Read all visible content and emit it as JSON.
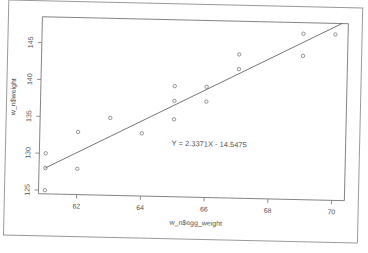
{
  "chart_data": {
    "type": "scatter",
    "title": "",
    "xlabel": "w_n$egg_weight",
    "ylabel": "w_n$weight",
    "xlim": [
      60.8,
      70.4
    ],
    "ylim": [
      124.5,
      148.5
    ],
    "x_ticks": [
      62,
      64,
      66,
      68,
      70
    ],
    "y_ticks": [
      125,
      130,
      135,
      140,
      145
    ],
    "grid": false,
    "legend": null,
    "annotation": "Y = 2.3371X - 14.5475",
    "regression": {
      "slope": 2.3371,
      "intercept": -14.5475
    },
    "points": [
      {
        "x": 61,
        "y": 125
      },
      {
        "x": 61,
        "y": 128
      },
      {
        "x": 61,
        "y": 130
      },
      {
        "x": 62,
        "y": 128
      },
      {
        "x": 62,
        "y": 133
      },
      {
        "x": 63,
        "y": 135
      },
      {
        "x": 64,
        "y": 133
      },
      {
        "x": 65,
        "y": 135
      },
      {
        "x": 65,
        "y": 137.5
      },
      {
        "x": 65,
        "y": 139.5
      },
      {
        "x": 66,
        "y": 137.5
      },
      {
        "x": 66,
        "y": 139.5
      },
      {
        "x": 67,
        "y": 142
      },
      {
        "x": 67,
        "y": 144
      },
      {
        "x": 69,
        "y": 144
      },
      {
        "x": 69,
        "y": 147
      },
      {
        "x": 70,
        "y": 147
      }
    ]
  },
  "colors": {
    "axis": "#6a6a6a",
    "point": "#6a6a6a",
    "line": "#555555",
    "text": "#555555",
    "frame": "#8a8a8a"
  }
}
